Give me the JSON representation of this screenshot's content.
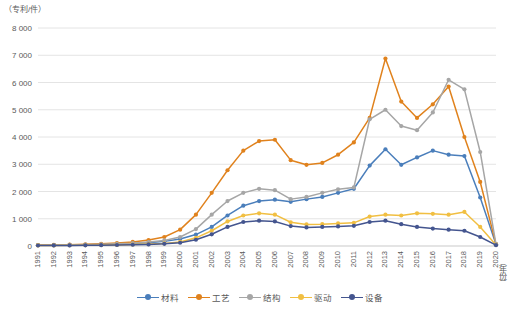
{
  "chart_data": {
    "type": "line",
    "title": "",
    "ylabel": "（专利/件）",
    "xlabel": "（年份）",
    "ylim": [
      0,
      8000
    ],
    "grid": true,
    "legend_position": "bottom",
    "ytick_labels": [
      "8 000",
      "7 000",
      "6 000",
      "5 000",
      "4 000",
      "3 000",
      "2 000",
      "1 000",
      "0"
    ],
    "ytick_values": [
      8000,
      7000,
      6000,
      5000,
      4000,
      3000,
      2000,
      1000,
      0
    ],
    "categories": [
      "1991",
      "1992",
      "1993",
      "1994",
      "1995",
      "1996",
      "1997",
      "1998",
      "1999",
      "2000",
      "2001",
      "2002",
      "2003",
      "2004",
      "2005",
      "2006",
      "2007",
      "2008",
      "2009",
      "2010",
      "2011",
      "2012",
      "2013",
      "2014",
      "2015",
      "2016",
      "2017",
      "2018",
      "2019",
      "2020"
    ],
    "series": [
      {
        "name": "材料",
        "color": "#4a7ebb",
        "values": [
          30,
          35,
          40,
          45,
          55,
          70,
          90,
          120,
          170,
          260,
          420,
          700,
          1120,
          1480,
          1650,
          1700,
          1620,
          1720,
          1800,
          1950,
          2100,
          2950,
          3550,
          2980,
          3250,
          3500,
          3350,
          3300,
          1780,
          60
        ]
      },
      {
        "name": "工艺",
        "color": "#e0821d",
        "values": [
          35,
          40,
          50,
          60,
          80,
          110,
          150,
          220,
          330,
          600,
          1150,
          1950,
          2780,
          3500,
          3850,
          3900,
          3150,
          2980,
          3050,
          3350,
          3800,
          4700,
          6880,
          5300,
          4700,
          5200,
          5850,
          4000,
          2350,
          70
        ]
      },
      {
        "name": "结构",
        "color": "#a6a6a6",
        "values": [
          30,
          35,
          42,
          50,
          62,
          80,
          105,
          145,
          205,
          330,
          620,
          1150,
          1650,
          1950,
          2100,
          2050,
          1720,
          1800,
          1950,
          2080,
          2150,
          4650,
          5000,
          4400,
          4250,
          4900,
          6100,
          5750,
          3450,
          60
        ]
      },
      {
        "name": "驱动",
        "color": "#f1bf42",
        "values": [
          20,
          22,
          25,
          28,
          33,
          40,
          52,
          70,
          95,
          150,
          300,
          560,
          900,
          1120,
          1200,
          1150,
          870,
          790,
          800,
          830,
          850,
          1080,
          1150,
          1120,
          1200,
          1180,
          1150,
          1250,
          700,
          40
        ]
      },
      {
        "name": "设备",
        "color": "#44558f",
        "values": [
          18,
          20,
          22,
          25,
          30,
          36,
          45,
          58,
          78,
          120,
          230,
          430,
          700,
          880,
          930,
          900,
          730,
          680,
          700,
          720,
          740,
          880,
          930,
          800,
          700,
          640,
          600,
          560,
          330,
          30
        ]
      }
    ]
  }
}
